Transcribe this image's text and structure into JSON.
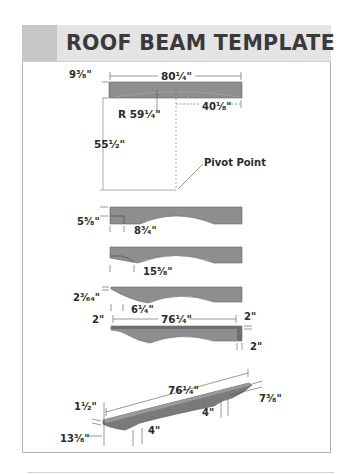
{
  "title": "ROOF BEAM TEMPLATE",
  "colors": {
    "header_bg": "#e4e4e4",
    "header_swatch": "#c6c6c6",
    "beam_fill": "#8e8e8e",
    "beam_dark": "#6e6e6e",
    "dim_line": "#555555",
    "text": "#2a2a2a"
  },
  "step1": {
    "thickness": "9³⁄₈\"",
    "length": "80¹⁄₄\"",
    "radius": "R 59¹⁄₄\"",
    "half_length": "40¹⁄₈\"",
    "pivot_offset": "55¹⁄₂\"",
    "pivot_label": "Pivot Point"
  },
  "step2": {
    "end_height": "5⁵⁄₈\"",
    "end_offset": "8³⁄₄\""
  },
  "step3": {
    "end_offset": "15⁵⁄₈\""
  },
  "step4": {
    "end_height": "2³⁄₆₄\"",
    "end_offset": "6¹⁄₄\""
  },
  "step5": {
    "left_trim": "2\"",
    "length": "76¹⁄₄\"",
    "top_trim": "2\"",
    "right_trim": "2\""
  },
  "step6": {
    "length": "76¹⁄₄\"",
    "end_thickness": "1¹⁄₂\"",
    "depth": "7³⁄₈\"",
    "left_foot": "4\"",
    "right_foot": "4\"",
    "foot_offset": "13³⁄₈\""
  }
}
